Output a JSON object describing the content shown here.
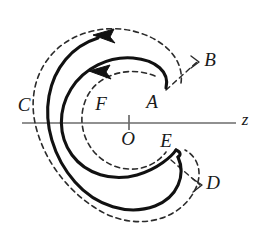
{
  "figure": {
    "name": "spiral-crescent-diagram",
    "background_color": "#ffffff",
    "solid_curve_color": "#111111",
    "dashed_curve_color": "#2b2b2b",
    "axis_color": "#6b6b6b",
    "label_color": "#1a1a1a",
    "axis": {
      "name": "z-axis",
      "label": "z",
      "origin_label": "O",
      "origin_tick": true,
      "x_start": 22,
      "x_end": 236,
      "y": 123,
      "origin_x": 129
    },
    "labels": [
      {
        "id": "A",
        "text": "A",
        "x": 152,
        "y": 104
      },
      {
        "id": "B",
        "text": "B",
        "x": 210,
        "y": 62
      },
      {
        "id": "C",
        "text": "C",
        "x": 24,
        "y": 107
      },
      {
        "id": "D",
        "text": "D",
        "x": 213,
        "y": 185
      },
      {
        "id": "E",
        "text": "E",
        "x": 166,
        "y": 143
      },
      {
        "id": "F",
        "text": "F",
        "x": 101,
        "y": 106
      },
      {
        "id": "O",
        "text": "O",
        "x": 128,
        "y": 141
      },
      {
        "id": "z",
        "text": "z",
        "x": 245,
        "y": 121
      }
    ],
    "arrows": [
      {
        "id": "outer-flow-arrow",
        "direction": "left",
        "x": 104,
        "y": 35
      },
      {
        "id": "inner-flow-arrow",
        "direction": "left",
        "x": 100,
        "y": 71
      }
    ],
    "curves": [
      {
        "id": "solid-spiral",
        "style": "solid",
        "width": 3.0
      },
      {
        "id": "dashed-outer-spiral",
        "style": "dashed",
        "width": 1.6
      },
      {
        "id": "dashed-inner-circle",
        "style": "dashed",
        "width": 1.6
      },
      {
        "id": "dashed-leader-b",
        "style": "dashed",
        "width": 1.4
      },
      {
        "id": "dashed-leader-d",
        "style": "dashed",
        "width": 1.4
      }
    ]
  }
}
